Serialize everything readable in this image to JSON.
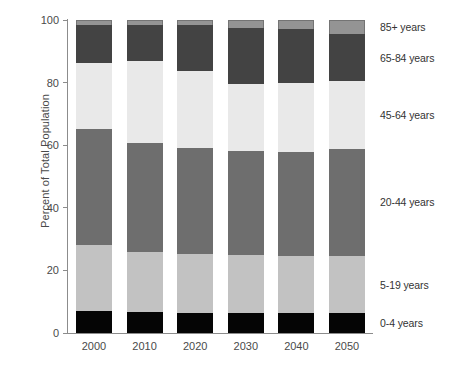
{
  "chart_data": {
    "type": "bar",
    "subtype": "stacked-bar-100-percent",
    "title": "",
    "xlabel": "",
    "ylabel": "Percent of Total Population",
    "ylim": [
      0,
      100
    ],
    "yticks": [
      0,
      20,
      40,
      60,
      80,
      100
    ],
    "grid": false,
    "legend_position": "right",
    "categories": [
      "2000",
      "2010",
      "2020",
      "2030",
      "2040",
      "2050"
    ],
    "series": [
      {
        "name": "0-4 years",
        "color": "#050505",
        "values": [
          6.9,
          6.6,
          6.5,
          6.4,
          6.3,
          6.3
        ]
      },
      {
        "name": "5-19 years",
        "color": "#c2c2c2",
        "values": [
          21.3,
          19.3,
          18.8,
          18.5,
          18.3,
          18.2
        ]
      },
      {
        "name": "20-44 years",
        "color": "#6e6e6e",
        "values": [
          36.9,
          34.8,
          33.8,
          33.2,
          33.2,
          34.3
        ]
      },
      {
        "name": "45-64 years",
        "color": "#e9e9e9",
        "values": [
          21.2,
          26.2,
          24.7,
          21.4,
          22.0,
          21.7
        ]
      },
      {
        "name": "65-84 years",
        "color": "#434343",
        "values": [
          12.0,
          11.6,
          14.5,
          18.0,
          17.2,
          15.0
        ]
      },
      {
        "name": "85+ years",
        "color": "#949494",
        "values": [
          1.7,
          1.5,
          1.7,
          2.5,
          3.0,
          4.5
        ]
      }
    ]
  },
  "legend": {
    "items": [
      {
        "label": "85+ years",
        "anchor_percent": 97.8
      },
      {
        "label": "65-84 years",
        "anchor_percent": 88.0
      },
      {
        "label": "45-64 years",
        "anchor_percent": 69.5
      },
      {
        "label": "20-44 years",
        "anchor_percent": 41.7
      },
      {
        "label": "5-19 years",
        "anchor_percent": 15.4
      },
      {
        "label": "0-4 years",
        "anchor_percent": 3.2
      }
    ]
  }
}
